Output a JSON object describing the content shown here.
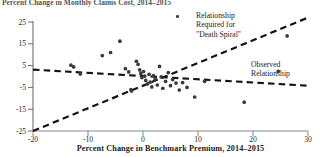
{
  "chart_data": {
    "type": "scatter",
    "title": "Percent Change in Monthly Claims Cost, 2014–2015",
    "xlabel": "Percent Change in Benchmark Premium, 2014–2015",
    "ylabel": "",
    "xlim": [
      -20,
      30
    ],
    "ylim": [
      -25,
      25
    ],
    "xticks": [
      -20,
      -10,
      0,
      10,
      20,
      30
    ],
    "xtick_labels": [
      "-20",
      "-10",
      "0",
      "10",
      "20",
      "30"
    ],
    "yticks": [
      25,
      15,
      5,
      -5,
      -15,
      -25
    ],
    "ytick_labels": [
      "25",
      "15",
      "5",
      "-5",
      "-15",
      "-25"
    ],
    "grid": false,
    "legend_position": "inside-top-center",
    "marker": "filled-circle",
    "marker_color": "#3a3a3a",
    "line_style": "dashed",
    "line_color": "#1a1a1a",
    "points": [
      [
        -13.1,
        5.2
      ],
      [
        -12.6,
        4.4
      ],
      [
        -11.4,
        1.2
      ],
      [
        -7.4,
        9.6
      ],
      [
        -5.9,
        11.0
      ],
      [
        -4.2,
        16.2
      ],
      [
        -3.2,
        3.6
      ],
      [
        -2.6,
        2.1
      ],
      [
        -2.2,
        -6.0
      ],
      [
        -2.1,
        -6.6
      ],
      [
        -1.2,
        7.0
      ],
      [
        -0.9,
        5.6
      ],
      [
        -0.6,
        3.0
      ],
      [
        -0.4,
        1.4
      ],
      [
        -0.2,
        -0.5
      ],
      [
        0.1,
        2.3
      ],
      [
        0.3,
        0.2
      ],
      [
        0.5,
        -1.8
      ],
      [
        0.8,
        -3.4
      ],
      [
        1.1,
        1.0
      ],
      [
        1.3,
        -2.6
      ],
      [
        1.6,
        -4.8
      ],
      [
        1.9,
        0.4
      ],
      [
        2.2,
        -1.1
      ],
      [
        2.6,
        -3.9
      ],
      [
        3.0,
        4.6
      ],
      [
        3.3,
        -0.2
      ],
      [
        3.6,
        -5.4
      ],
      [
        4.1,
        -2.2
      ],
      [
        4.6,
        1.8
      ],
      [
        5.0,
        -4.2
      ],
      [
        5.4,
        -1.4
      ],
      [
        6.0,
        -3.0
      ],
      [
        6.6,
        -6.2
      ],
      [
        7.2,
        -2.8
      ],
      [
        8.0,
        -5.0
      ],
      [
        9.4,
        -9.4
      ],
      [
        11.2,
        -2.2
      ],
      [
        18.4,
        -11.8
      ],
      [
        24.6,
        2.4
      ],
      [
        26.2,
        18.6
      ]
    ],
    "series": [
      {
        "name": "Relationship Required for \"Death Spiral\"",
        "type": "line",
        "style": "dashed",
        "x": [
          -20,
          30
        ],
        "values": [
          -25,
          27
        ],
        "slope": 1.04,
        "intercept": -4.4
      },
      {
        "name": "Observed Relationship",
        "type": "line",
        "style": "dashed",
        "x": [
          -20,
          30
        ],
        "values": [
          3.2,
          -4.2
        ],
        "slope": -0.148,
        "intercept": 0.24
      }
    ],
    "annotations": [
      {
        "name": "death-spiral-label",
        "lines": [
          "Relationship",
          "Required for",
          "\"Death Spiral\""
        ],
        "has_marker_swatch": true
      },
      {
        "name": "observed-label",
        "lines": [
          "Observed",
          "Relationship"
        ],
        "has_marker_swatch": false
      }
    ]
  }
}
